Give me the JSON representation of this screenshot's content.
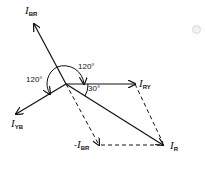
{
  "diagram": {
    "type": "phasor-diagram",
    "vectors": [
      {
        "id": "I_BR",
        "label_main": "I",
        "label_sub": "BR"
      },
      {
        "id": "I_YB",
        "label_main": "I",
        "label_sub": "YB"
      },
      {
        "id": "I_RY",
        "label_main": "I",
        "label_sub": "RY"
      },
      {
        "id": "I_R",
        "label_main": "I",
        "label_sub": "R"
      },
      {
        "id": "neg_I_BR",
        "label_prefix": "-",
        "label_main": "I",
        "label_sub": "BR"
      }
    ],
    "angles": {
      "upper": "120°",
      "left": "120°",
      "small": "30°"
    },
    "colors": {
      "ink": "#111111"
    }
  }
}
